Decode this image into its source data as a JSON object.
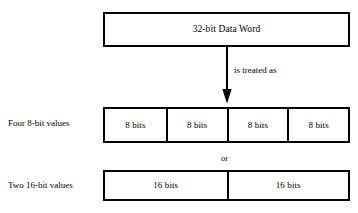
{
  "diagram": {
    "background_color": "#ffffff",
    "line_color": "#000000",
    "word_box": {
      "label": "32-bit Data Word"
    },
    "arrow": {
      "caption": "is treated as",
      "direction": "down"
    },
    "alternative_separator": {
      "label": "or"
    },
    "four_byte_row": {
      "row_label": "Four 8-bit values",
      "cells": [
        {
          "label": "8 bits"
        },
        {
          "label": "8 bits"
        },
        {
          "label": "8 bits"
        },
        {
          "label": "8 bits"
        }
      ]
    },
    "two_halfword_row": {
      "row_label": "Two 16-bit values",
      "cells": [
        {
          "label": "16 bits"
        },
        {
          "label": "16 bits"
        }
      ]
    }
  }
}
